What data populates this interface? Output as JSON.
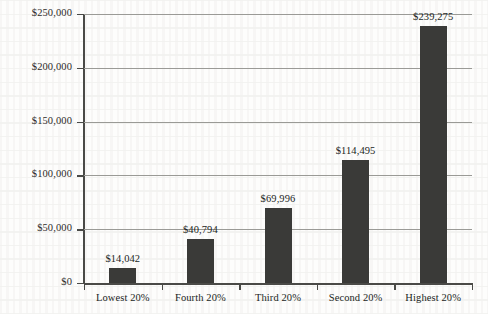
{
  "chart_data": {
    "type": "bar",
    "title": "",
    "subtitle": "",
    "xlabel": "",
    "ylabel": "",
    "categories": [
      "Lowest 20%",
      "Fourth 20%",
      "Third 20%",
      "Second 20%",
      "Highest 20%"
    ],
    "values": [
      14042,
      40794,
      69996,
      114495,
      239275
    ],
    "value_labels": [
      "$14,042",
      "$40,794",
      "$69,996",
      "$114,495",
      "$239,275"
    ],
    "series": [
      {
        "name": "",
        "values": [
          14042,
          40794,
          69996,
          114495,
          239275
        ]
      }
    ],
    "ylim": [
      0,
      250000
    ],
    "ytick_values": [
      0,
      50000,
      100000,
      150000,
      200000,
      250000
    ],
    "ytick_labels": [
      "$0",
      "$50,000",
      "$100,000",
      "$150,000",
      "$200,000",
      "$250,000"
    ],
    "grid": true,
    "grid_axis": "y",
    "legend": false,
    "legend_position": "none",
    "bar_color": "#3a3a38",
    "gridline_color": "#9a9a96",
    "axis_color": "#4a4a47",
    "background_color": "#fdfdfc",
    "text_color": "#221f1d"
  }
}
